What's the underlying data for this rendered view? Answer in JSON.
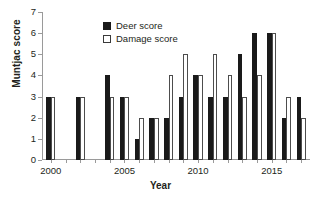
{
  "chart_data": {
    "type": "bar",
    "title": "",
    "xlabel": "Year",
    "ylabel": "Muntjac score",
    "categories": [
      2000,
      2001,
      2002,
      2003,
      2004,
      2005,
      2006,
      2007,
      2008,
      2009,
      2010,
      2011,
      2012,
      2013,
      2014,
      2015,
      2016,
      2017
    ],
    "series": [
      {
        "name": "Deer score",
        "color": "#1a1a1a",
        "style": "filled",
        "values": [
          3,
          null,
          3,
          null,
          4,
          3,
          1,
          2,
          2,
          3,
          4,
          3,
          3,
          5,
          6,
          6,
          2,
          3
        ]
      },
      {
        "name": "Damage score",
        "color": "#ffffff",
        "style": "outlined",
        "values": [
          3,
          null,
          3,
          null,
          3,
          3,
          2,
          2,
          4,
          5,
          4,
          5,
          4,
          3,
          4,
          6,
          3,
          2
        ]
      }
    ],
    "ylim": [
      0,
      7
    ],
    "ytick_values": [
      0,
      1,
      2,
      3,
      4,
      5,
      6,
      7
    ],
    "ytick_labels": [
      "0",
      "1",
      "2",
      "3",
      "4",
      "5",
      "6",
      "7"
    ],
    "xtick_values": [
      2000,
      2005,
      2010,
      2015
    ],
    "xtick_labels": [
      "2000",
      "2005",
      "2010",
      "2015"
    ],
    "xlim": [
      1999.4,
      2017.6
    ],
    "grid": false,
    "legend_position": "upper-center",
    "missing_years": [
      2001,
      2003
    ]
  },
  "legend": {
    "entries": [
      {
        "label": "Deer score"
      },
      {
        "label": "Damage score"
      }
    ]
  },
  "axes": {
    "y_title": "Muntjac score",
    "x_title": "Year"
  }
}
